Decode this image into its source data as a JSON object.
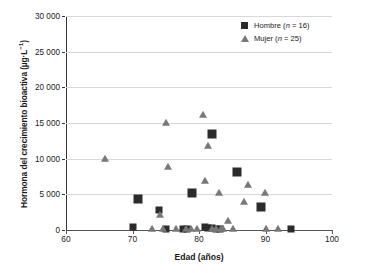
{
  "chart_data": {
    "type": "scatter",
    "title": "",
    "xlabel": "Edad (años)",
    "ylabel": "Hormona del crecimiento bioactiva (µg·L",
    "ylabel_sup": "−1",
    "ylabel_tail": ")",
    "xlim": [
      60,
      100
    ],
    "ylim": [
      0,
      30000
    ],
    "xticks": [
      60,
      70,
      80,
      90,
      100
    ],
    "xtick_labels": [
      "60",
      "70",
      "80",
      "90",
      "100"
    ],
    "yticks": [
      0,
      5000,
      10000,
      15000,
      20000,
      25000,
      30000
    ],
    "ytick_labels": [
      "0",
      "5 000",
      "10 000",
      "15 000",
      "20 000",
      "25 000",
      "30 000"
    ],
    "grid": "horizontal",
    "legend_position": "top-right",
    "colors": {
      "hombre": "#2b2b2b",
      "mujer": "#77777c",
      "axis": "#33333a",
      "grid": "#d8d8dc",
      "background": "#ffffff"
    },
    "series": [
      {
        "name": "Hombre",
        "n": 16,
        "marker": "square",
        "color": "#2b2b2b",
        "legend_label": "Hombre (",
        "legend_n_var": "n",
        "legend_n_value": " = 16)",
        "points": [
          {
            "x": 70.0,
            "y": 450
          },
          {
            "x": 70.8,
            "y": 4300
          },
          {
            "x": 74.0,
            "y": 2850
          },
          {
            "x": 75.0,
            "y": 180
          },
          {
            "x": 78.2,
            "y": 200
          },
          {
            "x": 79.0,
            "y": 5150
          },
          {
            "x": 80.9,
            "y": 400
          },
          {
            "x": 81.4,
            "y": 300
          },
          {
            "x": 81.9,
            "y": 13500
          },
          {
            "x": 82.0,
            "y": 250
          },
          {
            "x": 82.6,
            "y": 200
          },
          {
            "x": 83.2,
            "y": 180
          },
          {
            "x": 85.7,
            "y": 8150
          },
          {
            "x": 89.3,
            "y": 3250
          },
          {
            "x": 93.9,
            "y": 150
          },
          {
            "x": 77.6,
            "y": 150
          }
        ]
      },
      {
        "name": "Mujer",
        "n": 25,
        "marker": "triangle",
        "color": "#77777c",
        "legend_label": "Mujer (",
        "legend_n_var": "n",
        "legend_n_value": " = 25)",
        "points": [
          {
            "x": 65.9,
            "y": 9950
          },
          {
            "x": 73.0,
            "y": 150
          },
          {
            "x": 74.1,
            "y": 2050
          },
          {
            "x": 74.6,
            "y": 200
          },
          {
            "x": 75.1,
            "y": 15050
          },
          {
            "x": 75.3,
            "y": 8850
          },
          {
            "x": 78.0,
            "y": 150
          },
          {
            "x": 78.8,
            "y": 200
          },
          {
            "x": 79.7,
            "y": 150
          },
          {
            "x": 80.6,
            "y": 16100
          },
          {
            "x": 80.9,
            "y": 6900
          },
          {
            "x": 81.4,
            "y": 11800
          },
          {
            "x": 82.0,
            "y": 200
          },
          {
            "x": 82.6,
            "y": 150
          },
          {
            "x": 83.0,
            "y": 5150
          },
          {
            "x": 83.3,
            "y": 180
          },
          {
            "x": 83.6,
            "y": 200
          },
          {
            "x": 84.4,
            "y": 1300
          },
          {
            "x": 85.1,
            "y": 150
          },
          {
            "x": 86.8,
            "y": 3950
          },
          {
            "x": 87.4,
            "y": 6250
          },
          {
            "x": 89.9,
            "y": 5200
          },
          {
            "x": 90.1,
            "y": 150
          },
          {
            "x": 91.9,
            "y": 150
          },
          {
            "x": 76.6,
            "y": 150
          }
        ]
      }
    ]
  }
}
